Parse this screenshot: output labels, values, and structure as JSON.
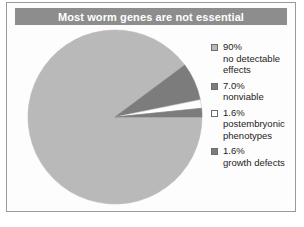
{
  "figure": {
    "title": "Most worm genes are not essential",
    "title_bar_color": "#8d8d8d",
    "title_text_color": "#ffffff",
    "frame_border_color": "#9a9a9a",
    "background_color": "#fdfdfd"
  },
  "chart_data": {
    "type": "pie",
    "title": "Most worm genes are not essential",
    "xlabel": "",
    "ylabel": "",
    "grid": false,
    "legend_position": "right",
    "start_angle_deg": 0,
    "direction": "clockwise",
    "categories": [
      "no detectable effects",
      "nonviable",
      "postembryonic phenotypes",
      "growth defects"
    ],
    "values": [
      90,
      7.0,
      1.6,
      1.6
    ],
    "value_labels": [
      "90%",
      "7.0%",
      "1.6%",
      "1.6%"
    ],
    "colors": [
      "#b9b9b9",
      "#7c7c7c",
      "#ffffff",
      "#7c7c7c"
    ],
    "slices": [
      {
        "label": "no detectable effects",
        "percent_label": "90%",
        "value": 90,
        "color": "#b9b9b9",
        "legend_lines": [
          "90%",
          "no detectable",
          "effects"
        ]
      },
      {
        "label": "nonviable",
        "percent_label": "7.0%",
        "value": 7.0,
        "color": "#7c7c7c",
        "legend_lines": [
          "7.0%",
          "nonviable"
        ]
      },
      {
        "label": "postembryonic phenotypes",
        "percent_label": "1.6%",
        "value": 1.6,
        "color": "#ffffff",
        "legend_lines": [
          "1.6%",
          "postembryonic",
          "phenotypes"
        ]
      },
      {
        "label": "growth defects",
        "percent_label": "1.6%",
        "value": 1.6,
        "color": "#7c7c7c",
        "legend_lines": [
          "1.6%",
          "growth defects"
        ]
      }
    ]
  },
  "legend": {
    "entries": [
      {
        "swatch_color": "#b9b9b9",
        "text": "90%\nno detectable\neffects"
      },
      {
        "swatch_color": "#7c7c7c",
        "text": "7.0%\nnonviable"
      },
      {
        "swatch_color": "#ffffff",
        "text": "1.6%\npostembryonic\nphenotypes"
      },
      {
        "swatch_color": "#7c7c7c",
        "text": "1.6%\ngrowth defects"
      }
    ]
  }
}
